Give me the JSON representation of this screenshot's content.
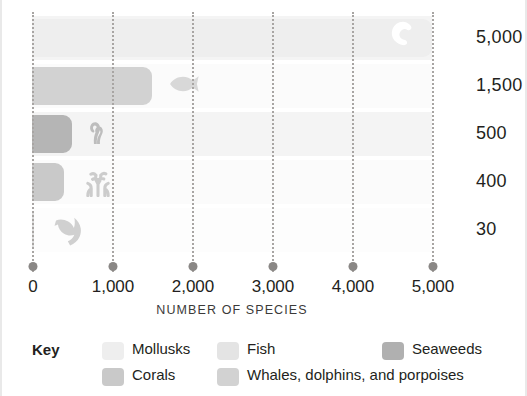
{
  "chart_data": {
    "type": "bar",
    "orientation": "horizontal",
    "title": "",
    "xlabel": "NUMBER OF SPECIES",
    "ylabel": "",
    "xlim": [
      0,
      5000
    ],
    "xticks": [
      0,
      1000,
      2000,
      3000,
      4000,
      5000
    ],
    "xticklabels": [
      "0",
      "1,000",
      "2,000",
      "3,000",
      "4,000",
      "5,000"
    ],
    "grid": true,
    "grid_style": "dotted-vertical",
    "legend_position": "bottom",
    "legend_title": "Key",
    "categories": [
      "Mollusks",
      "Fish",
      "Seaweeds",
      "Corals",
      "Whales, dolphins, and porpoises"
    ],
    "values": [
      5000,
      1500,
      500,
      400,
      30
    ],
    "value_labels": [
      "5,000",
      "1,500",
      "500",
      "400",
      "30"
    ],
    "colors": [
      "#eeeeee",
      "#d2d2d2",
      "#b5b5b5",
      "#c9c9c9",
      "#dcdcdc"
    ],
    "icons": [
      "shell-icon",
      "fish-icon",
      "seaweed-icon",
      "coral-icon",
      "dolphin-icon"
    ]
  },
  "bars": [
    {
      "label": "Mollusks",
      "value": 5000,
      "value_label": "5,000",
      "color": "#eeeeee",
      "icon": "shell-icon",
      "icon_color": "#ffffff"
    },
    {
      "label": "Fish",
      "value": 1500,
      "value_label": "1,500",
      "color": "#d2d2d2",
      "icon": "fish-icon",
      "icon_color": "#d8d8d8"
    },
    {
      "label": "Seaweeds",
      "value": 500,
      "value_label": "500",
      "color": "#b5b5b5",
      "icon": "seaweed-icon",
      "icon_color": "#bdbdbd"
    },
    {
      "label": "Corals",
      "value": 400,
      "value_label": "400",
      "color": "#c9c9c9",
      "icon": "coral-icon",
      "icon_color": "#cccccc"
    },
    {
      "label": "Whales, dolphins, and porpoises",
      "value": 30,
      "value_label": "30",
      "color": "#dcdcdc",
      "icon": "dolphin-icon",
      "icon_color": "#d0d0d0"
    }
  ],
  "row_bands": [
    "#f4f4f4",
    "#fbfbfb",
    "#f4f4f4",
    "#fbfbfb",
    "#fdfdfd"
  ],
  "axis": {
    "title": "NUMBER OF SPECIES",
    "ticks": [
      {
        "value": 0,
        "label": "0"
      },
      {
        "value": 1000,
        "label": "1,000"
      },
      {
        "value": 2000,
        "label": "2,000"
      },
      {
        "value": 3000,
        "label": "3,000"
      },
      {
        "value": 4000,
        "label": "4,000"
      },
      {
        "value": 5000,
        "label": "5,000"
      }
    ],
    "tick_dot_color": "#8a8785",
    "gridline_color": "#a8a5a3"
  },
  "legend": {
    "title": "Key",
    "items": [
      {
        "label": "Mollusks",
        "color": "#eeeeee",
        "col": 0,
        "row": 0
      },
      {
        "label": "Fish",
        "color": "#e4e4e4",
        "col": 1,
        "row": 0
      },
      {
        "label": "Seaweeds",
        "color": "#b0b0b0",
        "col": 2,
        "row": 0
      },
      {
        "label": "Corals",
        "color": "#c9c9c9",
        "col": 0,
        "row": 1
      },
      {
        "label": "Whales, dolphins, and porpoises",
        "color": "#d2d2d2",
        "col": 1,
        "row": 1
      }
    ]
  }
}
